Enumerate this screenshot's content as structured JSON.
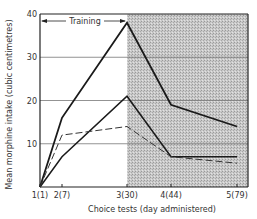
{
  "chart_data": {
    "type": "line",
    "title": "",
    "xlabel": "Choice tests (day administered)",
    "ylabel": "Mean morphine intake (cubic centimetres)",
    "x": [
      "1(1)",
      "2(7)",
      "3(30)",
      "4(44)",
      "5(79)"
    ],
    "x_positions": [
      1,
      2,
      3,
      4,
      5
    ],
    "ylim": [
      0,
      40
    ],
    "yticks": [
      10,
      20,
      30,
      40
    ],
    "grid": "horizontal",
    "annotations": [
      {
        "text": "Training",
        "type": "double-arrow-span",
        "from": "1(1)",
        "to": "3(30)"
      },
      {
        "text": "",
        "type": "shaded-region",
        "from": "3(30)",
        "to": "5(79)",
        "note": "stippled grey background after training"
      }
    ],
    "series": [
      {
        "name": "Series A (thick solid)",
        "style": "solid",
        "values": [
          0,
          16,
          38,
          19,
          14
        ]
      },
      {
        "name": "Series B (solid)",
        "style": "solid",
        "values": [
          0,
          7,
          21,
          7,
          7
        ]
      },
      {
        "name": "Series C (dashed)",
        "style": "dashed",
        "values": [
          0,
          12,
          14,
          7,
          5.5
        ]
      }
    ],
    "legend": null
  },
  "labels": {
    "training": "Training",
    "xlabel": "Choice tests (day administered)",
    "ylabel": "Mean morphine intake (cubic centimetres)"
  }
}
